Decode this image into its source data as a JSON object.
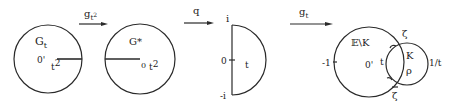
{
  "arrows": [
    {
      "label": "g",
      "sub": "t",
      "sup": "2"
    },
    {
      "label": "q"
    },
    {
      "label": "g",
      "sub": "t"
    }
  ],
  "panel1": {
    "region": "G",
    "region_sub": "t",
    "origin": "0",
    "point": "t",
    "point_sup": "2"
  },
  "panel2": {
    "region": "G*",
    "origin": "0",
    "point": "t",
    "point_sup": "2"
  },
  "panel3": {
    "top": "i",
    "origin": "0",
    "bottom": "-i",
    "point": "t"
  },
  "panel4": {
    "region_outer": "𝔼\\K",
    "region_inner": "K",
    "left_point": "-1",
    "origin": "0",
    "point_t": "t",
    "rho": "ρ",
    "right_point": "1/t",
    "zeta": "ζ",
    "zeta_bar": "ζ"
  }
}
